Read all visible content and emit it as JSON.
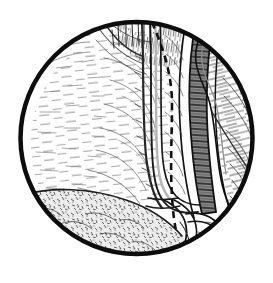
{
  "figure": {
    "domain": "Natural-Image",
    "kind": "line-art-illustration",
    "caption": "",
    "width": 273,
    "height": 283,
    "background_color": "#ffffff",
    "ink_color": "#111111",
    "frame": {
      "name": "circular-vignette-frame",
      "shape": "circle",
      "center_x": 136.5,
      "center_y": 138,
      "radius": 117,
      "stroke_color": "#0d0d0d",
      "stroke_width": 4.5
    },
    "regions": [
      {
        "name": "pale-organ-mass",
        "label": "large pale bulging organ (left)",
        "position": "left / upper-left",
        "fill": "#fdfdfd",
        "hatch": "sparse short horizontal strokes",
        "hatch_color": "#5a5a5a"
      },
      {
        "name": "fan-hatched-tissue",
        "label": "fan-shaped hatched tissue fold (upper middle)",
        "position": "upper-center",
        "fill": "#ffffff",
        "hatch": "radiating fan strokes",
        "hatch_color": "#3b3b3b"
      },
      {
        "name": "stippled-fat-pad",
        "label": "mottled granular fat / adipose tissue",
        "position": "bottom-left",
        "fill": "#e6e6e6",
        "hatch": "dense mottled stipple",
        "hatch_color": "#4a4a4a"
      },
      {
        "name": "lateral-wall-tissue",
        "label": "lateral wall with flowing hatch",
        "position": "right",
        "fill": "#ffffff",
        "hatch": "long curved parallel strokes",
        "hatch_color": "#444444"
      }
    ],
    "structures": [
      {
        "name": "dashed-incision-line",
        "label": "dashed incision / dissection plane line",
        "style": "dashed",
        "stroke_color": "#111111",
        "stroke_width": 2.6,
        "dash_pattern": "7 5"
      },
      {
        "name": "ureter-tubular-structure",
        "label": "pale tubular structure (ureter) running vertically",
        "style": "solid outline, light lumen",
        "stroke_color": "#1a1a1a",
        "stroke_width": 1.6
      },
      {
        "name": "major-vessel-dark",
        "label": "dark shaded major vessel with ladder cross-hatching",
        "style": "solid outline, dark cross-hatched fill",
        "stroke_color": "#111111",
        "fill": "#6a6a6a"
      },
      {
        "name": "vessel-branch-lower",
        "label": "branching vessel loop at lower pole",
        "style": "solid outline",
        "stroke_color": "#151515",
        "stroke_width": 1.8
      },
      {
        "name": "thin-vessel-right",
        "label": "thin vessel crossing to lower right",
        "style": "solid thin line",
        "stroke_color": "#222222",
        "stroke_width": 1.2
      }
    ],
    "annotations": {
      "labels": [],
      "leader_lines": []
    }
  }
}
